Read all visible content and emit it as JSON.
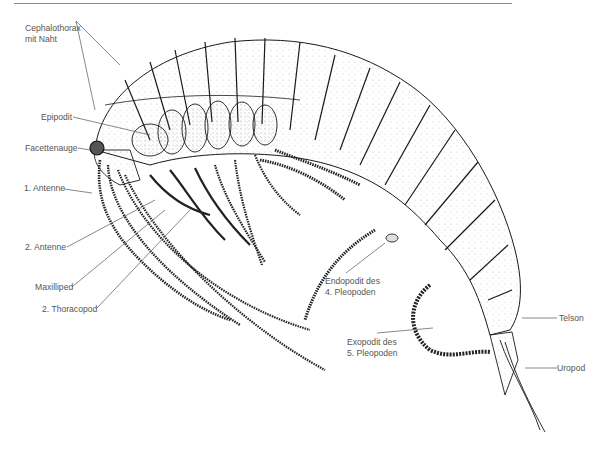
{
  "figure": {
    "colors": {
      "ink": "#1a1a1a",
      "label_text": "#555555",
      "leader_line": "#555555",
      "rule": "#8a8a8a",
      "background": "#ffffff"
    }
  },
  "labels": {
    "cephalothorax_line1": "Cephalothorax",
    "cephalothorax_line2": "mit Naht",
    "epipodit": "Epipodit",
    "facettenauge": "Facettenauge",
    "antenne1": "1. Antenne",
    "antenne2": "2. Antenne",
    "maxilliped": "Maxilliped",
    "thoracopod2": "2. Thoracopod",
    "endopodit_line1": "Endopodit des",
    "endopodit_line2": "4. Pleopoden",
    "exopodit_line1": "Exopodit des",
    "exopodit_line2": "5. Pleopoden",
    "telson": "Telson",
    "uropod": "Uropod"
  }
}
